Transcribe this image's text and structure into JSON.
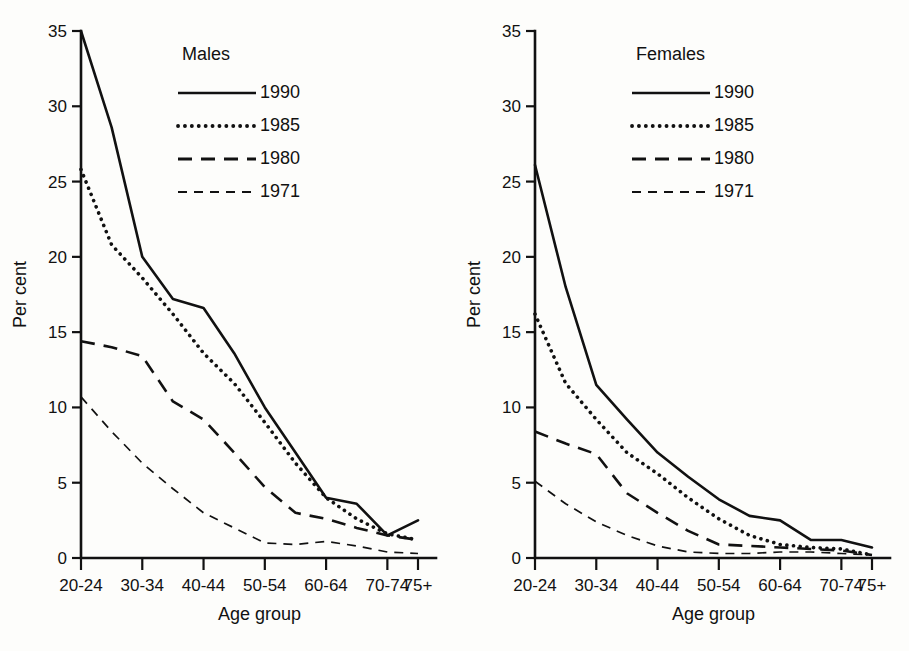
{
  "figure": {
    "panels": [
      {
        "id": "males",
        "legend_title": "Males",
        "ylabel": "Per cent",
        "xlabel": "Age group"
      },
      {
        "id": "females",
        "legend_title": "Females",
        "ylabel": "Per cent",
        "xlabel": "Age group"
      }
    ],
    "legend_entries": [
      "1990",
      "1985",
      "1980",
      "1971"
    ],
    "y_ticks": [
      "0",
      "5",
      "10",
      "15",
      "20",
      "25",
      "30",
      "35"
    ],
    "x_tick_labels": [
      "20-24",
      "30-34",
      "40-44",
      "50-54",
      "60-64",
      "70-74",
      "75+"
    ]
  },
  "chart_data": [
    {
      "type": "line",
      "title": "Males",
      "xlabel": "Age group",
      "ylabel": "Per cent",
      "ylim": [
        0,
        35
      ],
      "grid": false,
      "legend_position": "top-center-inside",
      "categories": [
        "20-24",
        "25-29",
        "30-34",
        "35-39",
        "40-44",
        "45-49",
        "50-54",
        "55-59",
        "60-64",
        "65-69",
        "70-74",
        "75+"
      ],
      "series": [
        {
          "name": "1990",
          "style": "solid",
          "values": [
            35.0,
            28.6,
            20.0,
            17.2,
            16.6,
            13.6,
            10.0,
            7.0,
            4.0,
            3.6,
            1.5,
            2.5
          ]
        },
        {
          "name": "1985",
          "style": "dotted",
          "values": [
            25.8,
            20.8,
            18.6,
            16.2,
            13.6,
            11.6,
            9.0,
            6.3,
            4.0,
            2.6,
            1.6,
            1.2
          ]
        },
        {
          "name": "1980",
          "style": "long-dash",
          "values": [
            14.4,
            14.0,
            13.4,
            10.4,
            9.2,
            7.0,
            4.7,
            3.0,
            2.6,
            2.0,
            1.5,
            1.2
          ]
        },
        {
          "name": "1971",
          "style": "short-dash",
          "values": [
            10.7,
            8.4,
            6.3,
            4.6,
            3.0,
            2.0,
            1.0,
            0.9,
            1.1,
            0.8,
            0.4,
            0.3
          ]
        }
      ]
    },
    {
      "type": "line",
      "title": "Females",
      "xlabel": "Age group",
      "ylabel": "Per cent",
      "ylim": [
        0,
        35
      ],
      "grid": false,
      "legend_position": "top-center-inside",
      "categories": [
        "20-24",
        "25-29",
        "30-34",
        "35-39",
        "40-44",
        "45-49",
        "50-54",
        "55-59",
        "60-64",
        "65-69",
        "70-74",
        "75+"
      ],
      "series": [
        {
          "name": "1990",
          "style": "solid",
          "values": [
            26.1,
            18.0,
            11.5,
            9.2,
            7.0,
            5.4,
            3.9,
            2.8,
            2.5,
            1.2,
            1.2,
            0.7
          ]
        },
        {
          "name": "1985",
          "style": "dotted",
          "values": [
            16.2,
            11.6,
            9.2,
            7.0,
            5.6,
            4.0,
            2.6,
            1.5,
            0.9,
            0.7,
            0.6,
            0.2
          ]
        },
        {
          "name": "1980",
          "style": "long-dash",
          "values": [
            8.4,
            7.6,
            6.9,
            4.3,
            3.0,
            1.8,
            0.9,
            0.8,
            0.7,
            0.6,
            0.5,
            0.2
          ]
        },
        {
          "name": "1971",
          "style": "short-dash",
          "values": [
            5.1,
            3.6,
            2.4,
            1.5,
            0.8,
            0.4,
            0.3,
            0.3,
            0.4,
            0.4,
            0.3,
            0.2
          ]
        }
      ]
    }
  ]
}
